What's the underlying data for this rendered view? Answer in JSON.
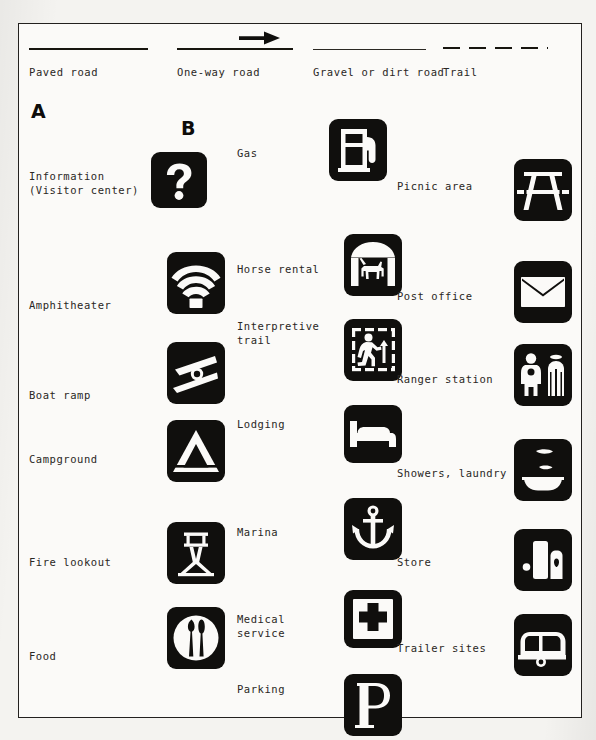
{
  "page": {
    "kind": "map-legend",
    "background_color": "#f4f3f0",
    "paper_color": "#fbfaf8",
    "ink_color": "#100f0d",
    "border_color": "#23211f"
  },
  "roads": {
    "items": [
      {
        "label": "Paved road",
        "style": "solid-thick",
        "icon": "solid-line-thick"
      },
      {
        "label": "One-way road",
        "style": "solid-thick-arrow",
        "icon": "one-way-arrow-line"
      },
      {
        "label": "Gravel or dirt road",
        "style": "solid-thin",
        "icon": "solid-line-thin"
      },
      {
        "label": "Trail",
        "style": "dashed",
        "icon": "dashed-line"
      }
    ]
  },
  "markers": [
    {
      "label": "A",
      "x": 30,
      "y": 99
    },
    {
      "label": "B",
      "x": 180,
      "y": 116
    }
  ],
  "columns": [
    {
      "name": "column-1",
      "entries": [
        {
          "label": "Information\n(Visitor center)",
          "icon": "information-icon",
          "lines": 2
        },
        {
          "label": "Amphitheater",
          "icon": "amphitheater-icon",
          "lines": 1
        },
        {
          "label": "Boat ramp",
          "icon": "boat-ramp-icon",
          "lines": 1
        },
        {
          "label": "Campground",
          "icon": "campground-icon",
          "lines": 1
        },
        {
          "label": "Fire lookout",
          "icon": "fire-lookout-icon",
          "lines": 1
        },
        {
          "label": "Food",
          "icon": "food-icon",
          "lines": 1
        }
      ]
    },
    {
      "name": "column-2",
      "entries": [
        {
          "label": "Gas",
          "icon": "gas-icon",
          "lines": 1
        },
        {
          "label": "Horse rental",
          "icon": "horse-rental-icon",
          "lines": 1
        },
        {
          "label": "Interpretive\ntrail",
          "icon": "interpretive-trail-icon",
          "lines": 2
        },
        {
          "label": "Lodging",
          "icon": "lodging-icon",
          "lines": 1
        },
        {
          "label": "Marina",
          "icon": "marina-icon",
          "lines": 1
        },
        {
          "label": "Medical\nservice",
          "icon": "medical-service-icon",
          "lines": 2
        },
        {
          "label": "Parking",
          "icon": "parking-icon",
          "lines": 1
        }
      ]
    },
    {
      "name": "column-3",
      "entries": [
        {
          "label": "Picnic area",
          "icon": "picnic-area-icon",
          "lines": 1
        },
        {
          "label": "Post office",
          "icon": "post-office-icon",
          "lines": 1
        },
        {
          "label": "Ranger station",
          "icon": "ranger-station-icon",
          "lines": 1
        },
        {
          "label": "Showers, laundry",
          "icon": "showers-laundry-icon",
          "lines": 1
        },
        {
          "label": "Store",
          "icon": "store-icon",
          "lines": 1
        },
        {
          "label": "Trailer sites",
          "icon": "trailer-sites-icon",
          "lines": 1
        }
      ]
    }
  ]
}
